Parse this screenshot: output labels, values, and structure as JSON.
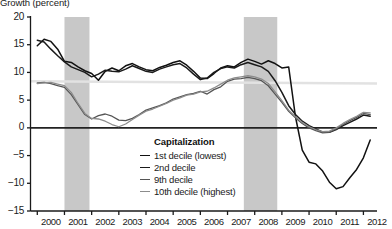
{
  "axis_title": "Growth (percent)",
  "legend": {
    "title": "Capitalization",
    "items": [
      {
        "label": "1st decile (lowest)",
        "color": "#111111"
      },
      {
        "label": "2nd decile",
        "color": "#1a1a1a"
      },
      {
        "label": "9th decile",
        "color": "#555555"
      },
      {
        "label": "10th decile (highest)",
        "color": "#8c8c8c"
      }
    ]
  },
  "chart_data": {
    "type": "line",
    "title": "Growth (percent)",
    "xlabel": "",
    "ylabel": "Growth (percent)",
    "xlim": [
      1999.75,
      2012.5
    ],
    "ylim": [
      -15,
      20
    ],
    "yticks": [
      20,
      15,
      10,
      5,
      0,
      -5,
      -10,
      -15
    ],
    "xticks": [
      2000,
      2001,
      2002,
      2003,
      2004,
      2005,
      2006,
      2007,
      2008,
      2009,
      2010,
      2011,
      2012
    ],
    "grid": false,
    "legend_position": "inside-lower-center",
    "zero_line": 0,
    "reference_line": {
      "label": "",
      "y_start": 8.4,
      "y_end": 8.0,
      "color": "#e2e2e2"
    },
    "shaded_recessions": [
      {
        "start": 2001.0,
        "end": 2001.92
      },
      {
        "start": 2007.6,
        "end": 2008.83
      }
    ],
    "shade_color": "#c8c8c8",
    "x": [
      2000.0,
      2000.25,
      2000.5,
      2000.75,
      2001.0,
      2001.25,
      2001.5,
      2001.75,
      2002.0,
      2002.25,
      2002.5,
      2002.75,
      2003.0,
      2003.25,
      2003.5,
      2003.75,
      2004.0,
      2004.25,
      2004.5,
      2004.75,
      2005.0,
      2005.25,
      2005.5,
      2005.75,
      2006.0,
      2006.25,
      2006.5,
      2006.75,
      2007.0,
      2007.25,
      2007.5,
      2007.75,
      2008.0,
      2008.25,
      2008.5,
      2008.75,
      2009.0,
      2009.25,
      2009.5,
      2009.75,
      2010.0,
      2010.25,
      2010.5,
      2010.75,
      2011.0,
      2011.25,
      2011.5,
      2011.75,
      2012.0,
      2012.25
    ],
    "series": [
      {
        "name": "1st decile (lowest)",
        "color": "#111111",
        "values": [
          14.8,
          16.0,
          15.6,
          14.2,
          12.0,
          11.8,
          11.0,
          10.3,
          9.8,
          8.6,
          10.2,
          10.8,
          10.3,
          11.2,
          11.6,
          11.0,
          10.5,
          10.3,
          10.9,
          11.3,
          11.8,
          12.1,
          11.3,
          10.2,
          9.0,
          8.9,
          9.8,
          10.8,
          11.2,
          11.0,
          11.8,
          12.4,
          12.0,
          11.5,
          12.1,
          11.6,
          10.8,
          11.0,
          2.0,
          -4.0,
          -6.2,
          -6.5,
          -7.8,
          -9.8,
          -11.0,
          -10.6,
          -9.0,
          -7.5,
          -5.4,
          -2.2
        ]
      },
      {
        "name": "2nd decile",
        "color": "#1a1a1a",
        "values": [
          15.8,
          15.5,
          14.2,
          13.0,
          11.9,
          11.0,
          10.5,
          10.0,
          9.2,
          9.7,
          10.4,
          10.2,
          10.1,
          10.6,
          11.2,
          10.7,
          10.2,
          10.0,
          10.6,
          11.0,
          11.4,
          11.6,
          10.8,
          9.7,
          8.7,
          9.0,
          10.0,
          10.7,
          11.0,
          10.8,
          11.4,
          11.8,
          11.4,
          11.0,
          10.2,
          8.5,
          6.4,
          4.0,
          2.4,
          1.2,
          0.4,
          -0.2,
          -0.8,
          -0.8,
          -0.3,
          0.4,
          1.0,
          1.6,
          2.3,
          2.1
        ]
      },
      {
        "name": "9th decile",
        "color": "#555555",
        "values": [
          8.1,
          8.2,
          8.0,
          7.6,
          7.3,
          6.0,
          4.2,
          2.4,
          1.6,
          2.2,
          2.5,
          2.1,
          1.4,
          1.3,
          1.7,
          2.4,
          3.2,
          3.6,
          4.0,
          4.5,
          5.2,
          5.6,
          6.0,
          6.2,
          6.6,
          6.1,
          6.9,
          7.4,
          8.4,
          8.8,
          8.9,
          9.1,
          8.9,
          8.5,
          7.6,
          6.1,
          4.6,
          3.0,
          1.8,
          0.8,
          0.0,
          -0.5,
          -0.9,
          -0.8,
          -0.2,
          0.6,
          1.3,
          1.9,
          2.6,
          2.4
        ]
      },
      {
        "name": "10th decile (highest)",
        "color": "#8c8c8c",
        "values": [
          8.0,
          8.1,
          8.2,
          7.9,
          7.6,
          6.4,
          4.4,
          2.6,
          1.7,
          1.6,
          1.2,
          0.6,
          0.2,
          0.7,
          1.5,
          2.3,
          3.0,
          3.4,
          3.9,
          4.4,
          5.0,
          5.4,
          5.9,
          6.1,
          6.5,
          6.6,
          7.2,
          7.9,
          8.6,
          9.0,
          9.2,
          9.4,
          9.2,
          8.8,
          8.0,
          6.5,
          4.9,
          3.2,
          2.0,
          1.0,
          0.2,
          -0.3,
          -0.7,
          -0.6,
          0.0,
          0.8,
          1.5,
          2.1,
          2.8,
          2.7
        ]
      }
    ]
  }
}
